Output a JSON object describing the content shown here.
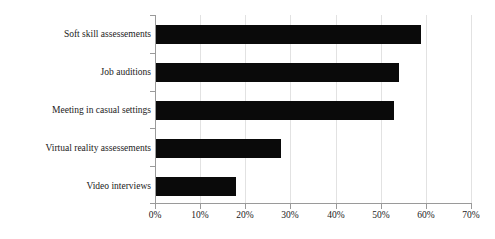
{
  "chart_data": {
    "type": "bar",
    "orientation": "horizontal",
    "title": "",
    "subtitle": "",
    "xlabel": "",
    "ylabel": "",
    "categories": [
      "Soft skill assessements",
      "Job auditions",
      "Meeting in casual settings",
      "Virtual reality assessements",
      "Video interviews"
    ],
    "values": [
      59,
      54,
      53,
      28,
      18
    ],
    "value_suffix": "%",
    "xlim": [
      0,
      70
    ],
    "xticks": [
      0,
      10,
      20,
      30,
      40,
      50,
      60,
      70
    ],
    "xtick_labels": [
      "0%",
      "10%",
      "20%",
      "30%",
      "40%",
      "50%",
      "60%",
      "70%"
    ],
    "grid": true,
    "grid_axis": "x",
    "legend": false,
    "legend_position": "none",
    "bar_color": "#0a0a0a",
    "grid_color": "#e2e2e2",
    "axis_color": "#9a9a9a",
    "text_color": "#1a1a1a",
    "background_color": "#ffffff"
  }
}
